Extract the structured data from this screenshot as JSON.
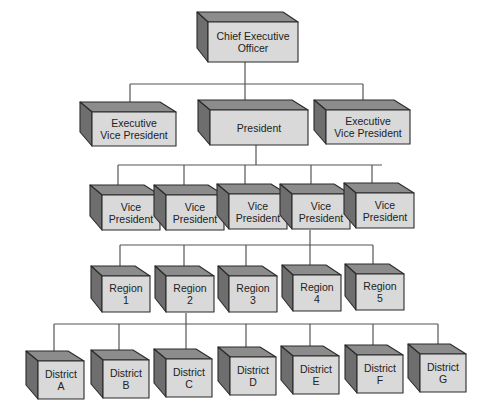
{
  "diagram": {
    "type": "organization-chart",
    "colors": {
      "front_face": "#d9d9d9",
      "top_face": "#8c8c8c",
      "side_face": "#6e6e6e",
      "outline": "#2b2b2b",
      "connector": "#555555"
    },
    "levels": [
      {
        "name": "executive",
        "nodes": [
          {
            "id": "ceo",
            "label": "Chief Executive\nOfficer"
          }
        ]
      },
      {
        "name": "senior",
        "nodes": [
          {
            "id": "evp1",
            "label": "Executive\nVice President"
          },
          {
            "id": "president",
            "label": "President"
          },
          {
            "id": "evp2",
            "label": "Executive\nVice President"
          }
        ]
      },
      {
        "name": "vice-presidents",
        "nodes": [
          {
            "id": "vp1",
            "label": "Vice\nPresident"
          },
          {
            "id": "vp2",
            "label": "Vice\nPresident"
          },
          {
            "id": "vp3",
            "label": "Vice\nPresident"
          },
          {
            "id": "vp4",
            "label": "Vice\nPresident"
          },
          {
            "id": "vp5",
            "label": "Vice\nPresident"
          }
        ]
      },
      {
        "name": "regions",
        "nodes": [
          {
            "id": "r1",
            "label": "Region\n1"
          },
          {
            "id": "r2",
            "label": "Region\n2"
          },
          {
            "id": "r3",
            "label": "Region\n3"
          },
          {
            "id": "r4",
            "label": "Region\n4"
          },
          {
            "id": "r5",
            "label": "Region\n5"
          }
        ]
      },
      {
        "name": "districts",
        "nodes": [
          {
            "id": "dA",
            "label": "District\nA"
          },
          {
            "id": "dB",
            "label": "District\nB"
          },
          {
            "id": "dC",
            "label": "District\nC"
          },
          {
            "id": "dD",
            "label": "District\nD"
          },
          {
            "id": "dE",
            "label": "District\nE"
          },
          {
            "id": "dF",
            "label": "District\nF"
          },
          {
            "id": "dG",
            "label": "District\nG"
          }
        ]
      }
    ],
    "edges": [
      [
        "ceo",
        "evp1"
      ],
      [
        "ceo",
        "president"
      ],
      [
        "ceo",
        "evp2"
      ],
      [
        "president",
        "vp1"
      ],
      [
        "president",
        "vp2"
      ],
      [
        "president",
        "vp3"
      ],
      [
        "president",
        "vp4"
      ],
      [
        "president",
        "vp5"
      ],
      [
        "vp4",
        "r1"
      ],
      [
        "vp4",
        "r2"
      ],
      [
        "vp4",
        "r3"
      ],
      [
        "vp4",
        "r4"
      ],
      [
        "vp4",
        "r5"
      ],
      [
        "r2",
        "dA"
      ],
      [
        "r2",
        "dB"
      ],
      [
        "r2",
        "dC"
      ],
      [
        "r2",
        "dD"
      ],
      [
        "r2",
        "dE"
      ],
      [
        "r2",
        "dF"
      ],
      [
        "r2",
        "dG"
      ]
    ]
  }
}
